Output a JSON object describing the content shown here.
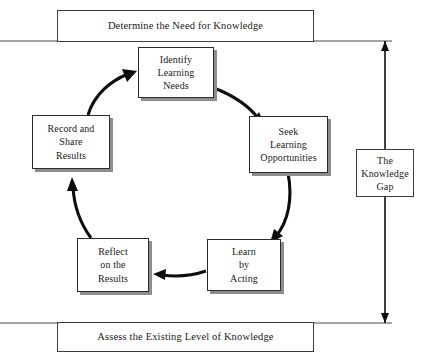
{
  "diagram": {
    "title_top": "Determine the Need for Knowledge",
    "title_bottom": "Assess the Existing Level of Knowledge",
    "gap_label_line1": "The",
    "gap_label_line2": "Knowledge",
    "gap_label_line3": "Gap"
  },
  "cycle": {
    "nodes": [
      {
        "id": "identify",
        "lines": [
          "Identify",
          "Learning",
          "Needs"
        ]
      },
      {
        "id": "seek",
        "lines": [
          "Seek",
          "Learning",
          "Opportunities"
        ]
      },
      {
        "id": "learn",
        "lines": [
          "Learn",
          "by",
          "Acting"
        ]
      },
      {
        "id": "reflect",
        "lines": [
          "Reflect",
          "on the",
          "Results"
        ]
      },
      {
        "id": "record",
        "lines": [
          "Record and",
          "Share",
          "Results"
        ]
      }
    ]
  },
  "colors": {
    "background": "#ffffff",
    "box_border": "#2b2b2b",
    "box_shadow": "#8d8d8d",
    "rule_line": "#4a4a4a",
    "arrow": "#0d0d0d",
    "text": "#1a1a1a"
  }
}
